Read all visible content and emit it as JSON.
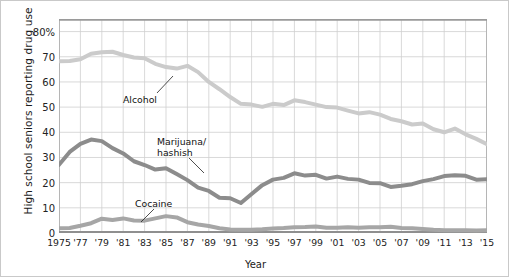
{
  "chart_data": {
    "type": "line",
    "title": "",
    "xlabel": "Year",
    "ylabel": "High school seniors reporting drug use",
    "xlim": [
      1975,
      2015
    ],
    "ylim": [
      0,
      85
    ],
    "ytick_labels": [
      "0",
      "10",
      "20",
      "30",
      "40",
      "50",
      "60",
      "70",
      "80%"
    ],
    "ytick_values": [
      0,
      10,
      20,
      30,
      40,
      50,
      60,
      70,
      80
    ],
    "xtick_labels": [
      "1975",
      "'77",
      "'79",
      "'81",
      "'83",
      "'85",
      "'87",
      "'89",
      "'91",
      "'93",
      "'95",
      "'97",
      "'99",
      "'01",
      "'03",
      "'05",
      "'07",
      "'09",
      "'11",
      "'13",
      "'15"
    ],
    "xtick_values": [
      1975,
      1977,
      1979,
      1981,
      1983,
      1985,
      1987,
      1989,
      1991,
      1993,
      1995,
      1997,
      1999,
      2001,
      2003,
      2005,
      2007,
      2009,
      2011,
      2013,
      2015
    ],
    "grid": true,
    "legend_position": "inline-annotations",
    "x": [
      1975,
      1976,
      1977,
      1978,
      1979,
      1980,
      1981,
      1982,
      1983,
      1984,
      1985,
      1986,
      1987,
      1988,
      1989,
      1990,
      1991,
      1992,
      1993,
      1994,
      1995,
      1996,
      1997,
      1998,
      1999,
      2000,
      2001,
      2002,
      2003,
      2004,
      2005,
      2006,
      2007,
      2008,
      2009,
      2010,
      2011,
      2012,
      2013,
      2014,
      2015
    ],
    "series": [
      {
        "name": "Alcohol",
        "color": "#cbcbcb",
        "label": "Alcohol",
        "values": [
          68.2,
          68.3,
          69.0,
          71.2,
          71.8,
          72.0,
          70.7,
          69.7,
          69.4,
          67.2,
          65.9,
          65.3,
          66.4,
          63.9,
          60.0,
          57.1,
          54.0,
          51.3,
          51.0,
          50.1,
          51.3,
          50.8,
          52.7,
          52.0,
          51.0,
          50.0,
          49.8,
          48.6,
          47.5,
          48.0,
          47.0,
          45.3,
          44.4,
          43.1,
          43.5,
          41.2,
          40.0,
          41.5,
          39.2,
          37.4,
          35.3
        ]
      },
      {
        "name": "Marijuana/hashish",
        "color": "#8c8c8c",
        "label": "Marijuana/\nhashish",
        "values": [
          27.1,
          32.2,
          35.4,
          37.1,
          36.5,
          33.7,
          31.6,
          28.5,
          27.0,
          25.2,
          25.7,
          23.4,
          21.0,
          18.0,
          16.7,
          14.0,
          13.8,
          11.9,
          15.5,
          19.0,
          21.2,
          21.9,
          23.7,
          22.8,
          23.1,
          21.6,
          22.4,
          21.5,
          21.2,
          19.9,
          19.8,
          18.3,
          18.8,
          19.4,
          20.6,
          21.4,
          22.6,
          22.9,
          22.7,
          21.2,
          21.3
        ]
      },
      {
        "name": "Cocaine",
        "color": "#a6a6a6",
        "label": "Cocaine",
        "values": [
          1.9,
          2.0,
          2.9,
          3.9,
          5.7,
          5.2,
          5.8,
          5.0,
          4.9,
          5.8,
          6.7,
          6.2,
          4.3,
          3.4,
          2.8,
          1.9,
          1.4,
          1.3,
          1.3,
          1.5,
          1.8,
          2.0,
          2.3,
          2.4,
          2.6,
          2.1,
          2.1,
          2.3,
          2.1,
          2.3,
          2.3,
          2.5,
          2.0,
          1.9,
          1.6,
          1.3,
          1.1,
          1.1,
          1.1,
          1.0,
          1.1
        ]
      }
    ],
    "annotations": [
      {
        "name": "alcohol-annotation",
        "text": "Alcohol",
        "x_px": 122,
        "y_px": 94,
        "leader": {
          "x1": 156,
          "y1": 92,
          "x2": 172,
          "y2": 75
        }
      },
      {
        "name": "marijuana-annotation",
        "text": "Marijuana/",
        "text2": "hashish",
        "x_px": 156,
        "y_px": 136,
        "leader": {
          "x1": 188,
          "y1": 157,
          "x2": 203,
          "y2": 172
        }
      },
      {
        "name": "cocaine-annotation",
        "text": "Cocaine",
        "x_px": 134,
        "y_px": 198,
        "leader": {
          "x1": 153,
          "y1": 208,
          "x2": 140,
          "y2": 221
        }
      }
    ]
  }
}
